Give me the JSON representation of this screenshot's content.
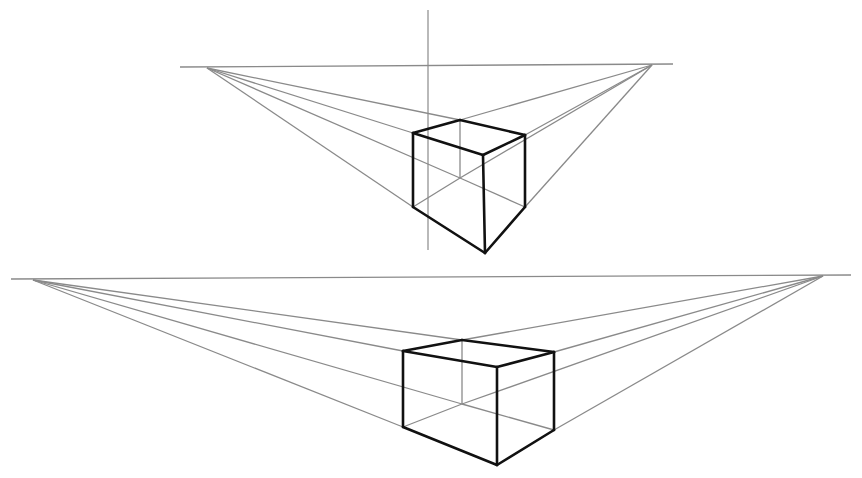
{
  "figure": {
    "title": "",
    "colors": {
      "guide": "#8a8a8a",
      "edge": "#111111",
      "background": "#ffffff"
    }
  },
  "drawings": [
    {
      "name": "two-point-perspective-cube-close",
      "horizon": {
        "x1": 180,
        "y1": 67,
        "x2": 673,
        "y2": 64
      },
      "vertical_guide": {
        "x1": 428,
        "y1": 10,
        "x2": 428,
        "y2": 250
      },
      "vp_left": [
        207,
        68
      ],
      "vp_right": [
        652,
        65
      ],
      "vertices": {
        "top_back": [
          460,
          120
        ],
        "top_left": [
          413,
          133
        ],
        "top_right": [
          525,
          135
        ],
        "top_front": [
          483,
          155
        ],
        "bottom_back": [
          460,
          178
        ],
        "bottom_left": [
          413,
          207
        ],
        "bottom_right": [
          525,
          207
        ],
        "bottom_front": [
          485,
          253
        ]
      }
    },
    {
      "name": "two-point-perspective-cube-wide",
      "horizon": {
        "x1": 11,
        "y1": 279,
        "x2": 851,
        "y2": 275
      },
      "vertical_guide": null,
      "vp_left": [
        33,
        280
      ],
      "vp_right": [
        823,
        276
      ],
      "vertices": {
        "top_back": [
          462,
          340
        ],
        "top_left": [
          403,
          351
        ],
        "top_right": [
          554,
          352
        ],
        "top_front": [
          497,
          367
        ],
        "bottom_back": [
          462,
          404
        ],
        "bottom_left": [
          403,
          427
        ],
        "bottom_right": [
          554,
          430
        ],
        "bottom_front": [
          497,
          465
        ]
      }
    }
  ]
}
